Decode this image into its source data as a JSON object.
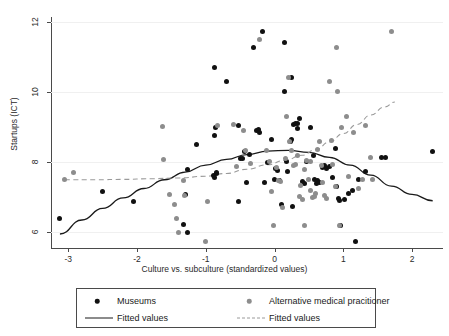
{
  "chart_data": {
    "type": "scatter",
    "title": "",
    "xlabel": "Culture vs. subculture (standardized values)",
    "ylabel": "Startups (ICT)",
    "xlim": [
      -3.25,
      2.45
    ],
    "ylim": [
      5.55,
      12.15
    ],
    "xticks": [
      -3,
      -2,
      -1,
      0,
      1,
      2
    ],
    "xticklabels": [
      "-3",
      "-2",
      "-1",
      "0",
      "1",
      "2"
    ],
    "yticks": [
      6,
      8,
      10,
      12
    ],
    "yticklabels": [
      "6",
      "8",
      "10",
      "12"
    ],
    "grid": "horizontal-faint",
    "legend_position": "below-axes",
    "colors": {
      "series_museums": "#111111",
      "series_alternative": "#8d8d8d",
      "fit_museums": "#1a1a1a",
      "fit_alternative": "#9a9a9a",
      "axis": "#4a4a4a",
      "gridline": "#f0f0f0",
      "background": "#ffffff"
    },
    "series": [
      {
        "name": "Museums",
        "marker": "filled-circle",
        "color": "#111111",
        "points": [
          [
            -3.12,
            6.4
          ],
          [
            -2.5,
            7.17
          ],
          [
            -2.05,
            6.87
          ],
          [
            -1.27,
            7.8
          ],
          [
            -1.33,
            6.22
          ],
          [
            -1.27,
            6.0
          ],
          [
            -1.3,
            7.08
          ],
          [
            -1.13,
            8.52
          ],
          [
            -0.87,
            10.7
          ],
          [
            -0.87,
            8.77
          ],
          [
            -0.86,
            9.0
          ],
          [
            -0.88,
            7.62
          ],
          [
            -0.87,
            7.57
          ],
          [
            -0.85,
            7.67
          ],
          [
            -0.84,
            7.7
          ],
          [
            -0.7,
            10.32
          ],
          [
            -0.53,
            9.05
          ],
          [
            -0.5,
            8.12
          ],
          [
            -0.47,
            8.1
          ],
          [
            -0.52,
            6.87
          ],
          [
            -0.44,
            8.32
          ],
          [
            -0.41,
            7.43
          ],
          [
            -0.37,
            8.22
          ],
          [
            -0.3,
            11.28
          ],
          [
            -0.26,
            8.9
          ],
          [
            -0.24,
            8.93
          ],
          [
            -0.22,
            8.85
          ],
          [
            -0.17,
            11.75
          ],
          [
            -0.15,
            7.42
          ],
          [
            -0.1,
            8.0
          ],
          [
            -0.05,
            8.65
          ],
          [
            0.0,
            7.52
          ],
          [
            0.02,
            7.82
          ],
          [
            0.04,
            7.77
          ],
          [
            0.07,
            7.48
          ],
          [
            0.1,
            6.78
          ],
          [
            0.14,
            11.42
          ],
          [
            0.14,
            10.02
          ],
          [
            0.17,
            8.02
          ],
          [
            0.19,
            7.73
          ],
          [
            0.23,
            8.6
          ],
          [
            0.25,
            8.65
          ],
          [
            0.24,
            10.42
          ],
          [
            0.27,
            9.07
          ],
          [
            0.26,
            6.75
          ],
          [
            0.3,
            9.1
          ],
          [
            0.33,
            9.12
          ],
          [
            0.34,
            8.97
          ],
          [
            0.37,
            9.25
          ],
          [
            0.4,
            7.45
          ],
          [
            0.43,
            7.4
          ],
          [
            0.46,
            8.02
          ],
          [
            0.52,
            9.0
          ],
          [
            0.56,
            8.2
          ],
          [
            0.58,
            7.52
          ],
          [
            0.61,
            7.38
          ],
          [
            0.63,
            7.47
          ],
          [
            0.66,
            7.42
          ],
          [
            0.7,
            7.85
          ],
          [
            0.72,
            7.9
          ],
          [
            0.76,
            7.82
          ],
          [
            0.8,
            7.88
          ],
          [
            0.84,
            7.57
          ],
          [
            0.88,
            8.38
          ],
          [
            0.9,
            7.3
          ],
          [
            0.93,
            6.97
          ],
          [
            0.95,
            6.92
          ],
          [
            0.96,
            6.18
          ],
          [
            1.02,
            6.95
          ],
          [
            1.08,
            7.12
          ],
          [
            1.13,
            7.2
          ],
          [
            1.18,
            5.73
          ],
          [
            1.22,
            7.52
          ],
          [
            1.32,
            7.75
          ],
          [
            1.55,
            8.13
          ],
          [
            1.62,
            8.13
          ],
          [
            2.3,
            8.3
          ]
        ]
      },
      {
        "name": "Alternative medical pracitioner",
        "marker": "filled-circle",
        "color": "#8d8d8d",
        "points": [
          [
            -3.05,
            7.5
          ],
          [
            -2.93,
            7.72
          ],
          [
            -1.63,
            9.02
          ],
          [
            -1.62,
            8.08
          ],
          [
            -1.52,
            7.07
          ],
          [
            -1.45,
            6.8
          ],
          [
            -1.42,
            6.38
          ],
          [
            -1.4,
            6.0
          ],
          [
            -1.33,
            7.47
          ],
          [
            -1.31,
            7.05
          ],
          [
            -1.0,
            5.73
          ],
          [
            -0.97,
            6.88
          ],
          [
            -0.83,
            9.05
          ],
          [
            -0.6,
            9.07
          ],
          [
            -0.55,
            7.88
          ],
          [
            -0.45,
            8.9
          ],
          [
            -0.42,
            8.33
          ],
          [
            -0.35,
            7.97
          ],
          [
            -0.22,
            11.52
          ],
          [
            -0.12,
            8.33
          ],
          [
            -0.07,
            8.03
          ],
          [
            -0.05,
            7.17
          ],
          [
            -0.02,
            6.18
          ],
          [
            0.03,
            7.85
          ],
          [
            0.06,
            7.47
          ],
          [
            0.09,
            7.45
          ],
          [
            0.12,
            6.72
          ],
          [
            0.16,
            8.12
          ],
          [
            0.18,
            9.3
          ],
          [
            0.2,
            10.42
          ],
          [
            0.22,
            8.6
          ],
          [
            0.25,
            8.33
          ],
          [
            0.28,
            7.9
          ],
          [
            0.3,
            7.95
          ],
          [
            0.33,
            8.18
          ],
          [
            0.36,
            7.02
          ],
          [
            0.38,
            7.33
          ],
          [
            0.4,
            6.95
          ],
          [
            0.43,
            6.18
          ],
          [
            0.47,
            8.05
          ],
          [
            0.5,
            7.52
          ],
          [
            0.52,
            7.2
          ],
          [
            0.55,
            6.98
          ],
          [
            0.58,
            7.02
          ],
          [
            0.62,
            8.37
          ],
          [
            0.65,
            8.6
          ],
          [
            0.68,
            7.9
          ],
          [
            0.7,
            7.42
          ],
          [
            0.73,
            7.05
          ],
          [
            0.76,
            6.97
          ],
          [
            0.8,
            10.3
          ],
          [
            0.83,
            8.62
          ],
          [
            0.85,
            7.95
          ],
          [
            0.88,
            7.32
          ],
          [
            0.9,
            11.28
          ],
          [
            0.92,
            10.02
          ],
          [
            0.95,
            6.18
          ],
          [
            0.98,
            8.98
          ],
          [
            1.05,
            9.3
          ],
          [
            1.08,
            7.6
          ],
          [
            1.15,
            8.85
          ],
          [
            1.22,
            7.25
          ],
          [
            1.28,
            7.5
          ],
          [
            1.33,
            9.05
          ],
          [
            1.4,
            8.15
          ],
          [
            1.42,
            7.52
          ],
          [
            1.7,
            11.75
          ],
          [
            0.52,
            8.02
          ],
          [
            0.44,
            7.78
          ],
          [
            0.6,
            7.12
          ]
        ]
      }
    ],
    "fits": [
      {
        "name": "Fitted values",
        "for_series": "Museums",
        "style": "solid",
        "color": "#1a1a1a",
        "shape": "quadratic-concave-down",
        "path_points": [
          [
            -3.12,
            5.95
          ],
          [
            -2.8,
            6.35
          ],
          [
            -2.5,
            6.68
          ],
          [
            -2.2,
            6.98
          ],
          [
            -1.9,
            7.25
          ],
          [
            -1.6,
            7.5
          ],
          [
            -1.3,
            7.72
          ],
          [
            -1.0,
            7.92
          ],
          [
            -0.7,
            8.08
          ],
          [
            -0.4,
            8.22
          ],
          [
            -0.1,
            8.32
          ],
          [
            0.2,
            8.34
          ],
          [
            0.5,
            8.28
          ],
          [
            0.8,
            8.14
          ],
          [
            1.1,
            7.92
          ],
          [
            1.4,
            7.63
          ],
          [
            1.7,
            7.32
          ],
          [
            2.0,
            7.08
          ],
          [
            2.3,
            6.9
          ]
        ]
      },
      {
        "name": "Fitted values",
        "for_series": "Alternative medical pracitioner",
        "style": "dashed",
        "color": "#9a9a9a",
        "shape": "upward-curving",
        "path_points": [
          [
            -3.05,
            7.5
          ],
          [
            -2.6,
            7.5
          ],
          [
            -2.2,
            7.51
          ],
          [
            -1.8,
            7.53
          ],
          [
            -1.4,
            7.55
          ],
          [
            -1.0,
            7.6
          ],
          [
            -0.7,
            7.68
          ],
          [
            -0.4,
            7.8
          ],
          [
            -0.1,
            7.93
          ],
          [
            0.15,
            8.05
          ],
          [
            0.4,
            8.2
          ],
          [
            0.6,
            8.36
          ],
          [
            0.8,
            8.58
          ],
          [
            1.0,
            8.82
          ],
          [
            1.2,
            9.08
          ],
          [
            1.4,
            9.35
          ],
          [
            1.6,
            9.58
          ],
          [
            1.75,
            9.72
          ]
        ]
      }
    ]
  },
  "legend": {
    "entries": [
      {
        "label": "Museums",
        "glyph": "dot",
        "color": "#111111"
      },
      {
        "label": "Alternative medical pracitioner",
        "glyph": "dot",
        "color": "#8d8d8d"
      },
      {
        "label": "Fitted values",
        "glyph": "solid-line",
        "color": "#1a1a1a"
      },
      {
        "label": "Fitted values",
        "glyph": "dashed-line",
        "color": "#9a9a9a"
      }
    ]
  }
}
